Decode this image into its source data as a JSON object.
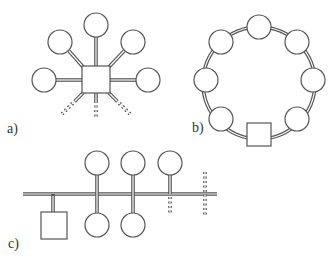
{
  "panels": [
    {
      "id": "a",
      "label": "a)",
      "topology": "star",
      "hub": "square",
      "nodes": 5,
      "extensions": 3
    },
    {
      "id": "b",
      "label": "b)",
      "topology": "ring",
      "hub": "square",
      "nodes": 7
    },
    {
      "id": "c",
      "label": "c)",
      "topology": "bus",
      "hub": "square",
      "nodes_above": 3,
      "nodes_below": 2,
      "extensions": 2
    }
  ],
  "colors": {
    "stroke": "#555555",
    "fill": "#ffffff",
    "text": "#333333"
  }
}
